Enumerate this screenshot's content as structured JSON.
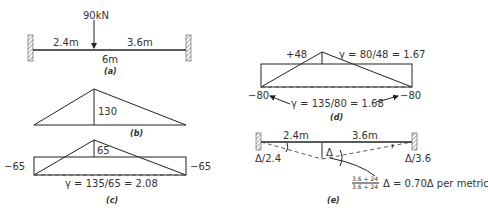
{
  "panel_a": {
    "load": "90kN",
    "left_span": "2.4m",
    "right_span": "3.6m",
    "total_span": "6m",
    "caption": "(a)"
  },
  "panel_b": {
    "peak": "130",
    "caption": "(b)"
  },
  "panel_c": {
    "peak": "65",
    "left_end": "−65",
    "right_end": "−65",
    "gamma": "γ = 135/65 = 2.08",
    "caption": "(c)"
  },
  "panel_d": {
    "peak": "+48",
    "gamma_peak": "γ = 80/48 = 1.67",
    "left_end": "−80",
    "right_end": "−80",
    "gamma_ends": "γ = 135/80 = 1.68",
    "caption": "(d)"
  },
  "panel_e": {
    "left_span": "2.4m",
    "right_span": "3.6m",
    "delta": "Δ",
    "left_rotation": "Δ/2.4",
    "right_rotation": "Δ/3.6",
    "frac_num": "3.6 + 24",
    "frac_den": "3.6 + 24",
    "result": "Δ = 0.70Δ per metric",
    "caption": "(e)"
  }
}
